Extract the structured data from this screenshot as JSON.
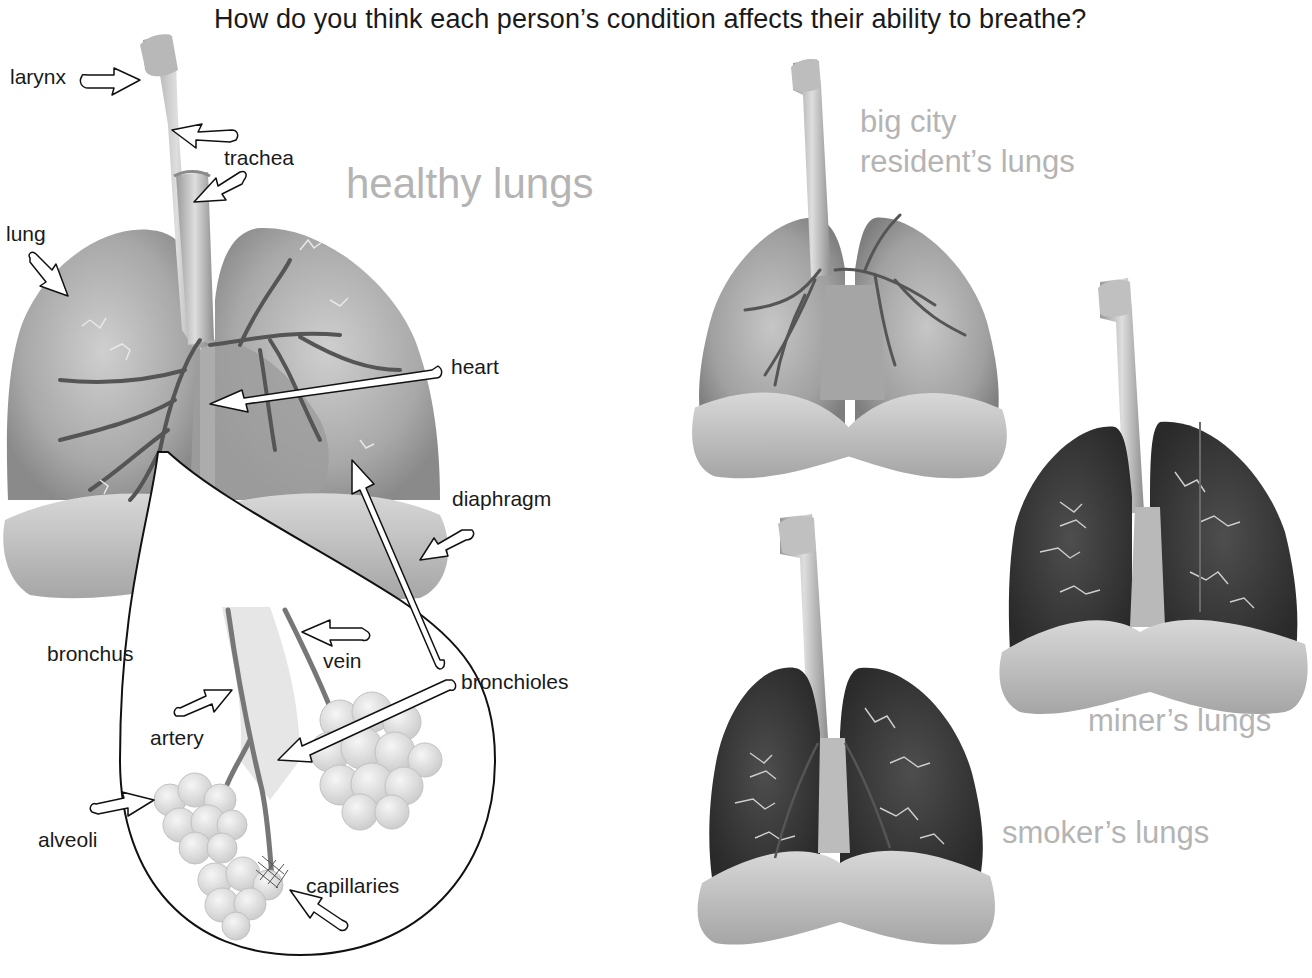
{
  "title": "How do you think each person’s condition affects their ability to breathe?",
  "healthy": {
    "caption": "healthy lungs",
    "labels": {
      "larynx": "larynx",
      "trachea": "trachea",
      "lung": "lung",
      "heart": "heart",
      "diaphragm": "diaphragm",
      "bronchus": "bronchus",
      "vein": "vein",
      "bronchioles": "bronchioles",
      "artery": "artery",
      "alveoli": "alveoli",
      "capillaries": "capillaries"
    }
  },
  "city": {
    "caption_line1": "big city",
    "caption_line2": "resident’s lungs"
  },
  "miner": {
    "caption": "miner’s lungs"
  },
  "smoker": {
    "caption": "smoker’s lungs"
  },
  "colors": {
    "healthy_lung": "#a9a9a9",
    "city_lung": "#9c9c9c",
    "miner_lung": "#3c3c3c",
    "smoker_lung": "#363636",
    "caption_gray": "#b4b4b4",
    "airway": "#5a5a5a"
  }
}
